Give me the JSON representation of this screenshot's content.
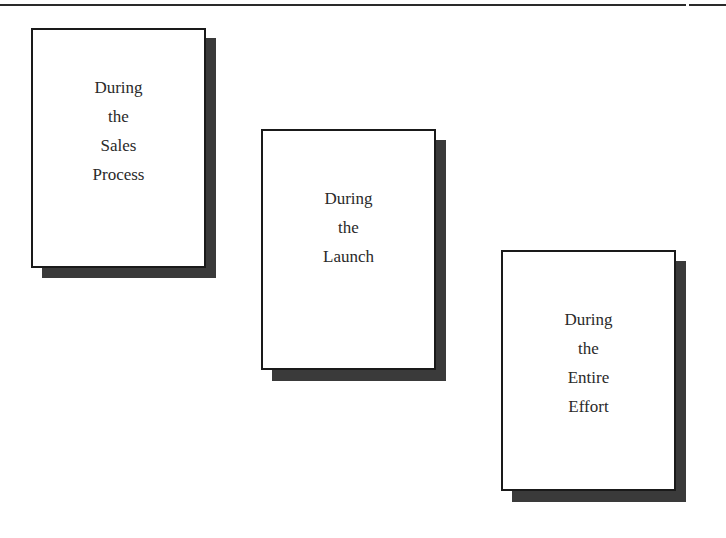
{
  "diagram": {
    "type": "three staggered cards with drop shadows",
    "colors": {
      "background": "#ffffff",
      "border": "#1a1a1a",
      "shadow": "#3a3a3a",
      "text": "#2a2a2a"
    },
    "cards": [
      {
        "id": "sales-process",
        "lines": [
          "During",
          "the",
          "Sales",
          "Process"
        ]
      },
      {
        "id": "launch",
        "lines": [
          "During",
          "the",
          "Launch"
        ]
      },
      {
        "id": "entire-effort",
        "lines": [
          "During",
          "the",
          "Entire",
          "Effort"
        ]
      }
    ]
  }
}
